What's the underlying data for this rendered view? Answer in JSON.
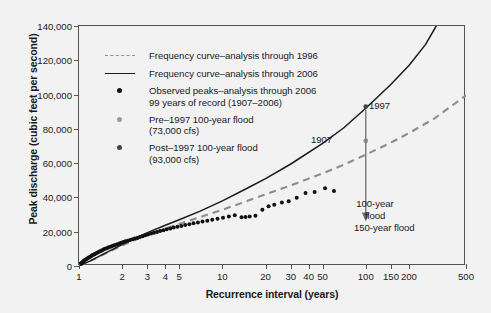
{
  "chart_data": {
    "type": "line",
    "title": "",
    "xlabel": "Recurrence interval (years)",
    "ylabel": "Peak discharge (cubic feet per second)",
    "xscale": "log",
    "xlim": [
      1,
      500
    ],
    "ylim": [
      0,
      140000
    ],
    "grid": false,
    "legend_position": "upper-left-inside",
    "x_ticks": [
      {
        "value": 1,
        "label": "1"
      },
      {
        "value": 2,
        "label": "2"
      },
      {
        "value": 3,
        "label": "3"
      },
      {
        "value": 4,
        "label": "4"
      },
      {
        "value": 5,
        "label": "5"
      },
      {
        "value": 10,
        "label": "10"
      },
      {
        "value": 20,
        "label": "20"
      },
      {
        "value": 30,
        "label": "30"
      },
      {
        "value": 40,
        "label": "40"
      },
      {
        "value": 50,
        "label": "50"
      },
      {
        "value": 100,
        "label": "100"
      },
      {
        "value": 150,
        "label": "150"
      },
      {
        "value": 200,
        "label": "200"
      },
      {
        "value": 500,
        "label": "500"
      }
    ],
    "y_ticks": [
      {
        "value": 0,
        "label": "0"
      },
      {
        "value": 20000,
        "label": "20,000"
      },
      {
        "value": 40000,
        "label": "40,000"
      },
      {
        "value": 60000,
        "label": "60,000"
      },
      {
        "value": 80000,
        "label": "80,000"
      },
      {
        "value": 100000,
        "label": "100,000"
      },
      {
        "value": 120000,
        "label": "120,000"
      },
      {
        "value": 140000,
        "label": "140,000"
      }
    ],
    "series": [
      {
        "name": "Frequency curve-analysis through 1996",
        "style": "dashed",
        "color": "#8d8d8d",
        "points": [
          [
            1,
            0
          ],
          [
            1.2,
            3000
          ],
          [
            1.5,
            7000
          ],
          [
            2,
            12000
          ],
          [
            2.5,
            15500
          ],
          [
            3,
            18200
          ],
          [
            4,
            21800
          ],
          [
            5,
            24500
          ],
          [
            7,
            28500
          ],
          [
            10,
            32800
          ],
          [
            15,
            38000
          ],
          [
            20,
            41800
          ],
          [
            30,
            47000
          ],
          [
            50,
            54000
          ],
          [
            70,
            59000
          ],
          [
            100,
            65000
          ],
          [
            150,
            72000
          ],
          [
            200,
            77500
          ],
          [
            300,
            86000
          ],
          [
            500,
            99500
          ]
        ]
      },
      {
        "name": "Frequency curve-analysis through 2006",
        "style": "solid",
        "color": "#1a1a1a",
        "points": [
          [
            1,
            0
          ],
          [
            1.2,
            3000
          ],
          [
            1.5,
            7200
          ],
          [
            2,
            12500
          ],
          [
            2.5,
            16500
          ],
          [
            3,
            19500
          ],
          [
            4,
            23800
          ],
          [
            5,
            27000
          ],
          [
            7,
            32000
          ],
          [
            10,
            38000
          ],
          [
            15,
            45500
          ],
          [
            20,
            51000
          ],
          [
            30,
            59500
          ],
          [
            50,
            71500
          ],
          [
            70,
            80500
          ],
          [
            100,
            92000
          ],
          [
            150,
            106000
          ],
          [
            200,
            117000
          ],
          [
            260,
            129000
          ],
          [
            310,
            140000
          ]
        ]
      }
    ],
    "scatter": [
      {
        "name": "Observed peaks-analysis through 2006, 99 years of record (1907-2006)",
        "color": "#111111",
        "points": [
          [
            1.01,
            700
          ],
          [
            1.02,
            1100
          ],
          [
            1.03,
            1500
          ],
          [
            1.05,
            2000
          ],
          [
            1.06,
            2400
          ],
          [
            1.08,
            2900
          ],
          [
            1.09,
            3300
          ],
          [
            1.11,
            3700
          ],
          [
            1.13,
            4100
          ],
          [
            1.15,
            4500
          ],
          [
            1.17,
            4900
          ],
          [
            1.19,
            5300
          ],
          [
            1.21,
            5700
          ],
          [
            1.23,
            6100
          ],
          [
            1.25,
            6400
          ],
          [
            1.28,
            6800
          ],
          [
            1.3,
            7200
          ],
          [
            1.33,
            7600
          ],
          [
            1.36,
            8000
          ],
          [
            1.39,
            8400
          ],
          [
            1.42,
            8800
          ],
          [
            1.45,
            9200
          ],
          [
            1.48,
            9600
          ],
          [
            1.52,
            10000
          ],
          [
            1.56,
            10400
          ],
          [
            1.6,
            10800
          ],
          [
            1.64,
            11100
          ],
          [
            1.69,
            11500
          ],
          [
            1.74,
            11900
          ],
          [
            1.79,
            12300
          ],
          [
            1.85,
            12700
          ],
          [
            1.91,
            13100
          ],
          [
            1.97,
            13500
          ],
          [
            2.04,
            14000
          ],
          [
            2.11,
            14400
          ],
          [
            2.19,
            14800
          ],
          [
            2.27,
            15200
          ],
          [
            2.36,
            15600
          ],
          [
            2.45,
            16000
          ],
          [
            2.55,
            16400
          ],
          [
            2.66,
            16900
          ],
          [
            2.78,
            17400
          ],
          [
            2.9,
            17900
          ],
          [
            3.03,
            18400
          ],
          [
            3.18,
            18900
          ],
          [
            3.33,
            19400
          ],
          [
            3.5,
            19900
          ],
          [
            3.68,
            20400
          ],
          [
            3.88,
            20900
          ],
          [
            4.09,
            21400
          ],
          [
            4.33,
            21900
          ],
          [
            4.58,
            22400
          ],
          [
            4.86,
            22900
          ],
          [
            5.17,
            23400
          ],
          [
            5.5,
            23900
          ],
          [
            5.88,
            24400
          ],
          [
            6.29,
            24900
          ],
          [
            6.75,
            25400
          ],
          [
            7.27,
            25900
          ],
          [
            7.85,
            26400
          ],
          [
            8.5,
            27000
          ],
          [
            9.25,
            27600
          ],
          [
            10.1,
            28200
          ],
          [
            11.1,
            28900
          ],
          [
            12.2,
            29600
          ],
          [
            13.6,
            28400
          ],
          [
            14.5,
            28600
          ],
          [
            15.5,
            28900
          ],
          [
            17,
            29300
          ],
          [
            19,
            32800
          ],
          [
            21,
            34900
          ],
          [
            23,
            35700
          ],
          [
            26,
            37100
          ],
          [
            29,
            37800
          ],
          [
            33,
            39800
          ],
          [
            38,
            42600
          ],
          [
            44,
            43100
          ],
          [
            52,
            45300
          ],
          [
            60,
            43800
          ]
        ]
      },
      {
        "name": "Pre-1997 100-year flood (73,000 cfs)",
        "color": "#9a9a9a",
        "points": [
          [
            100,
            73000
          ]
        ]
      },
      {
        "name": "Post-1997 100-year flood (93,000 cfs)",
        "color": "#444444",
        "points": [
          [
            100,
            93000
          ]
        ]
      }
    ],
    "annotations": [
      {
        "name": "1997-peak-label",
        "text": "1997",
        "x": 100,
        "y": 93000
      },
      {
        "name": "1907-peak-label",
        "text": "1907",
        "x": 50,
        "y": 75000
      },
      {
        "name": "100-year-flood-arrow-label",
        "text": "100-year\nflood",
        "x": 100,
        "y": 30000
      },
      {
        "name": "150-year-flood-label",
        "text": "150-year flood",
        "x": 150,
        "y": 18000
      }
    ]
  },
  "legend": {
    "items": [
      {
        "key": "dashed-line",
        "label": "Frequency curve–analysis through 1996",
        "color": "#8d8d8d"
      },
      {
        "key": "solid-line",
        "label": "Frequency curve–analysis through 2006",
        "color": "#1a1a1a"
      },
      {
        "key": "black-dot",
        "label": "Observed peaks–analysis through 2006\n99 years of record (1907–2006)",
        "color": "#111111"
      },
      {
        "key": "gray-dot",
        "label": "Pre–1997 100-year flood\n(73,000 cfs)",
        "color": "#9a9a9a"
      },
      {
        "key": "darkgray-dot",
        "label": "Post–1997 100-year flood\n(93,000 cfs)",
        "color": "#444444"
      }
    ]
  },
  "annotations": {
    "peak_1997": "1997",
    "peak_1907": "1907",
    "flood_100_year": "100-year\nflood",
    "flood_150_year": "150-year flood"
  },
  "axes": {
    "x_title": "Recurrence interval (years)",
    "y_title": "Peak discharge (cubic feet per second)"
  },
  "colors": {
    "background": "#f2f2f2",
    "frame": "#555555",
    "curve_1996": "#8d8d8d",
    "curve_2006": "#1a1a1a",
    "observed": "#111111",
    "pre_1997": "#9a9a9a",
    "post_1997": "#444444",
    "arrow": "#6f6f6f"
  }
}
